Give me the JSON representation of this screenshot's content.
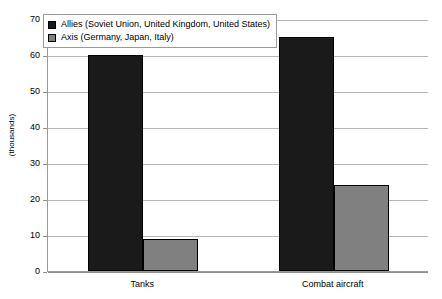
{
  "chart_data": {
    "type": "bar",
    "title": "",
    "xlabel": "",
    "ylabel": "(thousands)",
    "categories": [
      "Tanks",
      "Combat aircraft"
    ],
    "series": [
      {
        "name": "Allies (Soviet Union, United Kingdom, United States)",
        "color": "#1a1a1a",
        "values": [
          60,
          65
        ]
      },
      {
        "name": "Axis (Germany, Japan, Italy)",
        "color": "#808080",
        "values": [
          9,
          24
        ]
      }
    ],
    "ylim": [
      0,
      70
    ],
    "ytick_labels": [
      "0",
      "10",
      "20",
      "30",
      "40",
      "50",
      "60",
      "70"
    ],
    "ytick_values": [
      0,
      10,
      20,
      30,
      40,
      50,
      60,
      70
    ],
    "grid": true,
    "legend_position": "top-left"
  },
  "legend": {
    "items": [
      {
        "label": "Allies (Soviet Union, United Kingdom, United States)",
        "swatch": "black-square-icon"
      },
      {
        "label": "Axis (Germany, Japan, Italy)",
        "swatch": "gray-square-icon"
      }
    ]
  }
}
